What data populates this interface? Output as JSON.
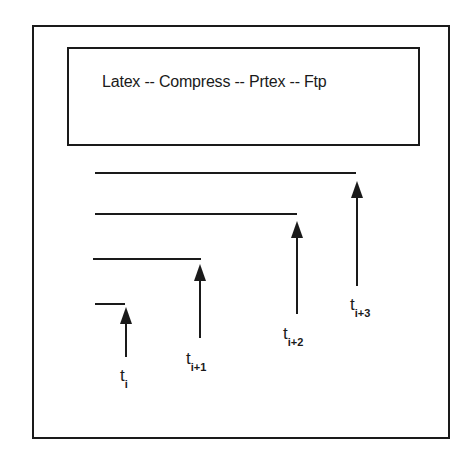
{
  "title_box": {
    "text": "Latex -- Compress -- Prtex -- Ftp"
  },
  "timelines": [
    {
      "label_base": "t",
      "label_sub": "i",
      "line": {
        "x1": 95,
        "x2": 125,
        "y": 304
      },
      "arrow": {
        "x": 126,
        "top": 307,
        "bottom": 357
      },
      "label_pos": {
        "x": 120,
        "y": 367
      }
    },
    {
      "label_base": "t",
      "label_sub": "i+1",
      "line": {
        "x1": 93,
        "x2": 201,
        "y": 259
      },
      "arrow": {
        "x": 200,
        "top": 264,
        "bottom": 338
      },
      "label_pos": {
        "x": 186,
        "y": 350
      }
    },
    {
      "label_base": "t",
      "label_sub": "i+2",
      "line": {
        "x1": 95,
        "x2": 297,
        "y": 214
      },
      "arrow": {
        "x": 297,
        "top": 221,
        "bottom": 314
      },
      "label_pos": {
        "x": 283,
        "y": 325
      }
    },
    {
      "label_base": "t",
      "label_sub": "i+3",
      "line": {
        "x1": 95,
        "x2": 356,
        "y": 173
      },
      "arrow": {
        "x": 357,
        "top": 181,
        "bottom": 286
      },
      "label_pos": {
        "x": 350,
        "y": 296
      }
    }
  ],
  "colors": {
    "ink": "#1a1a1a",
    "background": "#ffffff"
  }
}
